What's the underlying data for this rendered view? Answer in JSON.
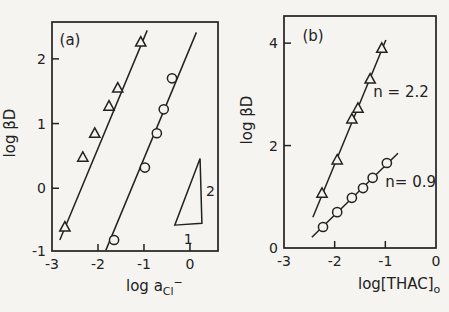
{
  "figure": {
    "background": "#f5f4f1",
    "ink": "#222222"
  },
  "chart_data": [
    {
      "id": "a",
      "type": "scatter",
      "panel_label": "(a)",
      "ylabel": "log βD",
      "xlabel_parts": [
        {
          "t": "log a",
          "style": "base"
        },
        {
          "t": "Cl",
          "style": "sub"
        },
        {
          "t": "−",
          "style": "sup"
        }
      ],
      "xlim": [
        -3,
        0.61
      ],
      "ylim": [
        -0.97,
        2.57
      ],
      "xticks": [
        -3,
        -2,
        -1,
        0
      ],
      "yticks": [
        -1,
        0,
        1,
        2
      ],
      "grid": false,
      "series": [
        {
          "name": "triangle-series",
          "marker": "triangle",
          "points": [
            [
              -2.72,
              -0.6
            ],
            [
              -2.33,
              0.48
            ],
            [
              -2.07,
              0.85
            ],
            [
              -1.76,
              1.27
            ],
            [
              -1.57,
              1.55
            ],
            [
              -1.07,
              2.26
            ]
          ],
          "fit_line": [
            [
              -2.83,
              -0.8
            ],
            [
              -0.93,
              2.44
            ]
          ]
        },
        {
          "name": "circle-series",
          "marker": "circle",
          "points": [
            [
              -1.65,
              -0.8
            ],
            [
              -0.98,
              0.32
            ],
            [
              -0.72,
              0.85
            ],
            [
              -0.57,
              1.22
            ],
            [
              -0.39,
              1.7
            ]
          ],
          "fit_line": [
            [
              -1.83,
              -0.96
            ],
            [
              0.14,
              2.41
            ]
          ]
        }
      ],
      "slope_indicator": {
        "vertices": [
          [
            -0.33,
            -0.57
          ],
          [
            0.26,
            -0.54
          ],
          [
            0.22,
            0.46
          ]
        ],
        "labels": [
          {
            "text": "2",
            "x": 0.35,
            "y": -0.05,
            "anchor": "start"
          },
          {
            "text": "1",
            "x": -0.04,
            "y": -0.78,
            "anchor": "middle"
          }
        ]
      },
      "annotations": []
    },
    {
      "id": "b",
      "type": "scatter",
      "panel_label": "(b)",
      "ylabel": "log βD",
      "xlabel_parts": [
        {
          "t": "log[THAC]",
          "style": "base"
        },
        {
          "t": "o",
          "style": "sub"
        }
      ],
      "xlim": [
        -3,
        0
      ],
      "ylim": [
        0,
        4.53
      ],
      "xticks": [
        -3,
        -2,
        -1,
        0
      ],
      "yticks": [
        0,
        2,
        4
      ],
      "grid": false,
      "series": [
        {
          "name": "triangle-series",
          "marker": "triangle",
          "points": [
            [
              -2.25,
              1.07
            ],
            [
              -1.95,
              1.72
            ],
            [
              -1.66,
              2.52
            ],
            [
              -1.54,
              2.73
            ],
            [
              -1.3,
              3.3
            ],
            [
              -1.07,
              3.9
            ]
          ],
          "fit_line": [
            [
              -2.43,
              0.6
            ],
            [
              -0.99,
              4.06
            ]
          ]
        },
        {
          "name": "circle-series",
          "marker": "circle",
          "points": [
            [
              -2.23,
              0.41
            ],
            [
              -1.95,
              0.7
            ],
            [
              -1.66,
              0.98
            ],
            [
              -1.44,
              1.17
            ],
            [
              -1.25,
              1.37
            ],
            [
              -0.97,
              1.66
            ]
          ],
          "fit_line": [
            [
              -2.45,
              0.21
            ],
            [
              -0.75,
              1.85
            ]
          ]
        }
      ],
      "slope_indicator": null,
      "annotations": [
        {
          "text": "n = 2.2",
          "x": -0.69,
          "y": 3.05,
          "anchor": "middle"
        },
        {
          "text": "n= 0.9",
          "x": -0.5,
          "y": 1.29,
          "anchor": "middle"
        }
      ]
    }
  ]
}
